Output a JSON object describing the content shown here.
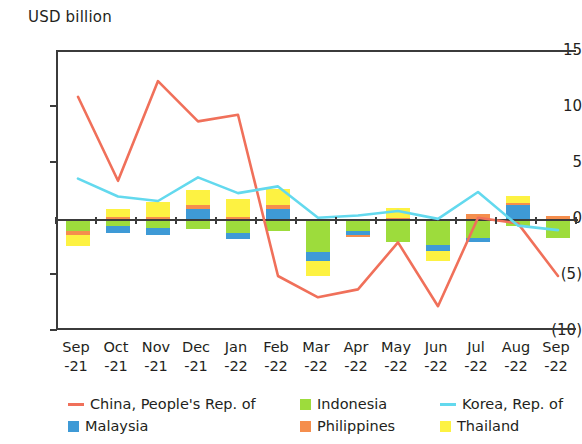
{
  "chart_data": {
    "type": "bar",
    "title": "",
    "subtitle": "",
    "ylabel": "USD billion",
    "xlabel": "",
    "ylim": [
      -10,
      15
    ],
    "yticks": [
      15,
      10,
      5,
      0,
      -5,
      -10
    ],
    "ytick_labels": [
      "15",
      "10",
      "5",
      "0",
      "(5)",
      "(10)"
    ],
    "grid": false,
    "legend_position": "bottom",
    "stacked": true,
    "categories": [
      "Sep-21",
      "Oct-21",
      "Nov-21",
      "Dec-21",
      "Jan-22",
      "Feb-22",
      "Mar-22",
      "Apr-22",
      "May-22",
      "Jun-22",
      "Jul-22",
      "Aug-22",
      "Sep-22"
    ],
    "category_lines": [
      [
        "Sep",
        "-21"
      ],
      [
        "Oct",
        "-21"
      ],
      [
        "Nov",
        "-21"
      ],
      [
        "Dec",
        "-21"
      ],
      [
        "Jan",
        "-22"
      ],
      [
        "Feb",
        "-22"
      ],
      [
        "Mar",
        "-22"
      ],
      [
        "Apr",
        "-22"
      ],
      [
        "May",
        "-22"
      ],
      [
        "Jun",
        "-22"
      ],
      [
        "Jul",
        "-22"
      ],
      [
        "Aug",
        "-22"
      ],
      [
        "Sep",
        "-22"
      ]
    ],
    "series": [
      {
        "name": "China, People's Rep. of",
        "type": "line",
        "color": "#f0705a",
        "values": [
          11.0,
          3.5,
          12.4,
          8.8,
          9.4,
          -5.0,
          -6.9,
          -6.2,
          -2.0,
          -7.7,
          0.2,
          -0.3,
          -5.0
        ]
      },
      {
        "name": "Korea, Rep. of",
        "type": "line",
        "color": "#63d9ee",
        "values": [
          3.7,
          2.1,
          1.7,
          3.8,
          2.4,
          3.0,
          0.2,
          0.4,
          0.8,
          0.1,
          2.5,
          -0.5,
          -0.9
        ]
      },
      {
        "name": "Indonesia",
        "type": "bar",
        "color": "#9ddc3c",
        "values": [
          -1.0,
          -0.5,
          -0.7,
          -0.8,
          -1.2,
          -1.0,
          -2.9,
          -1.0,
          -2.0,
          -2.2,
          -1.6,
          -0.5,
          -1.6
        ]
      },
      {
        "name": "Malaysia",
        "type": "bar",
        "color": "#3e9ad6",
        "values": [
          0.0,
          -0.7,
          -0.6,
          1.0,
          -0.5,
          1.0,
          -0.8,
          -0.3,
          0.0,
          -0.6,
          -0.4,
          1.3,
          0.0
        ]
      },
      {
        "name": "Philippines",
        "type": "bar",
        "color": "#f58e4d",
        "values": [
          -0.3,
          0.3,
          0.3,
          0.3,
          0.3,
          0.3,
          0.0,
          -0.2,
          0.2,
          0.1,
          0.5,
          0.2,
          0.4
        ]
      },
      {
        "name": "Thailand",
        "type": "bar",
        "color": "#fdf242",
        "values": [
          -1.0,
          0.7,
          1.3,
          1.4,
          1.6,
          1.5,
          -1.3,
          0.0,
          0.9,
          -0.9,
          0.0,
          0.6,
          0.0
        ]
      }
    ]
  },
  "legend": {
    "items": [
      {
        "label": "China, People's Rep. of",
        "color": "#f0705a",
        "marker": "line"
      },
      {
        "label": "Indonesia",
        "color": "#9ddc3c",
        "marker": "box"
      },
      {
        "label": "Korea, Rep. of",
        "color": "#63d9ee",
        "marker": "line"
      },
      {
        "label": "Malaysia",
        "color": "#3e9ad6",
        "marker": "box"
      },
      {
        "label": "Philippines",
        "color": "#f58e4d",
        "marker": "box"
      },
      {
        "label": "Thailand",
        "color": "#fdf242",
        "marker": "box"
      }
    ]
  }
}
